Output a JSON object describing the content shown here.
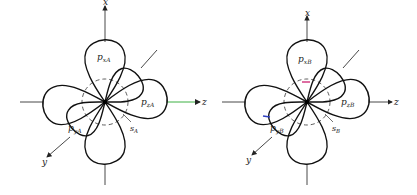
{
  "diagrams": [
    {
      "id": "atom-A",
      "center": [
        105,
        102
      ],
      "axes": {
        "x": "x",
        "y": "y",
        "z": "z"
      },
      "orbitals": {
        "px": {
          "label": "p",
          "sub": "xA"
        },
        "py": {
          "label": "p",
          "sub": "yA"
        },
        "pz": {
          "label": "p",
          "sub": "zA"
        },
        "s": {
          "label": "s",
          "sub": "A"
        }
      },
      "highlight_colors": {
        "z_axis": "#3cb043"
      }
    },
    {
      "id": "atom-B",
      "center": [
        307,
        102
      ],
      "axes": {
        "x": "x",
        "y": "y",
        "z": "z"
      },
      "orbitals": {
        "px": {
          "label": "p",
          "sub": "xB"
        },
        "py": {
          "label": "p",
          "sub": "yB"
        },
        "pz": {
          "label": "p",
          "sub": "zB"
        },
        "s": {
          "label": "s",
          "sub": "B"
        }
      },
      "highlight_colors": {
        "px_mark": "#d0307a",
        "py_mark": "#3040c0"
      }
    }
  ]
}
